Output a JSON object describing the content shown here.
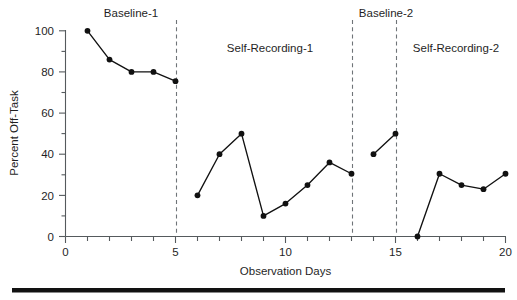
{
  "chart_data": {
    "type": "line",
    "title": "",
    "xlabel": "Observation Days",
    "ylabel": "Percent Off-Task",
    "xlim": [
      0,
      20
    ],
    "ylim": [
      0,
      100
    ],
    "grid": false,
    "legend": "none",
    "x_ticks_major": [
      0,
      5,
      10,
      15,
      20
    ],
    "x_tick_labels": [
      "0",
      "5",
      "10",
      "15",
      "20"
    ],
    "x_ticks_minor": [
      1,
      2,
      3,
      4,
      6,
      7,
      8,
      9,
      11,
      12,
      13,
      14,
      16,
      17,
      18,
      19
    ],
    "y_ticks_major": [
      0,
      20,
      40,
      60,
      80,
      100
    ],
    "y_tick_labels": [
      "0",
      "20",
      "40",
      "60",
      "80",
      "100"
    ],
    "y_ticks_minor": [
      10,
      30,
      50,
      70,
      90
    ],
    "marker": "filled-circle",
    "line_color": "#111111",
    "phase_change_lines": [
      5.5,
      13.5,
      15.5
    ],
    "phases": [
      {
        "name": "Baseline-1",
        "label": "Baseline-1",
        "x": [
          1,
          2,
          3,
          4,
          5
        ],
        "y": [
          100,
          86,
          80,
          80,
          75.5
        ]
      },
      {
        "name": "Self-Recording-1",
        "label": "Self-Recording-1",
        "x": [
          6,
          7,
          8,
          9,
          10,
          11,
          12,
          13
        ],
        "y": [
          20,
          40,
          50,
          10,
          16,
          25,
          36,
          30.5
        ]
      },
      {
        "name": "Baseline-2",
        "label": "Baseline-2",
        "x": [
          14,
          15
        ],
        "y": [
          40,
          50
        ]
      },
      {
        "name": "Self-Recording-2",
        "label": "Self-Recording-2",
        "x": [
          16,
          17,
          18,
          19,
          20
        ],
        "y": [
          0,
          30.5,
          25,
          23,
          30.5
        ]
      }
    ],
    "phase_label_positions": [
      {
        "label": "Baseline-1",
        "x_center": 3.0,
        "y_value": 107
      },
      {
        "label": "Self-Recording-1",
        "x_center": 9.3,
        "y_value": 93
      },
      {
        "label": "Baseline-2",
        "x_center": 14.6,
        "y_value": 107
      },
      {
        "label": "Self-Recording-2",
        "x_center": 18.3,
        "y_value": 93
      }
    ]
  }
}
